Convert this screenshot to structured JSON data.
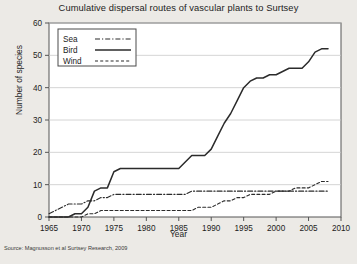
{
  "chart_data": {
    "type": "line",
    "title": "Cumulative dispersal routes of vascular plants to Surtsey",
    "xlabel": "Year",
    "ylabel": "Number of species",
    "xlim": [
      1965,
      2010
    ],
    "ylim": [
      0,
      60
    ],
    "xticks": [
      1965,
      1970,
      1975,
      1980,
      1985,
      1990,
      1995,
      2000,
      2005,
      2010
    ],
    "yticks": [
      0,
      10,
      20,
      30,
      40,
      50,
      60
    ],
    "grid": "horizontal",
    "legend_position": "top-left",
    "source": "Source: Magnusson et al Surtsey Research, 2009",
    "series": [
      {
        "name": "Sea",
        "style": "dash-dot",
        "x": [
          1965,
          1966,
          1967,
          1968,
          1969,
          1970,
          1971,
          1972,
          1973,
          1974,
          1975,
          1976,
          1977,
          1978,
          1979,
          1980,
          1981,
          1982,
          1983,
          1984,
          1985,
          1986,
          1987,
          1988,
          1989,
          1990,
          1991,
          1992,
          1993,
          1994,
          1995,
          1996,
          1997,
          1998,
          1999,
          2000,
          2001,
          2002,
          2003,
          2004,
          2005,
          2006,
          2007,
          2008
        ],
        "values": [
          1,
          2,
          3,
          4,
          4,
          4,
          5,
          5,
          6,
          6,
          7,
          7,
          7,
          7,
          7,
          7,
          7,
          7,
          7,
          7,
          7,
          7,
          8,
          8,
          8,
          8,
          8,
          8,
          8,
          8,
          8,
          8,
          8,
          8,
          8,
          8,
          8,
          8,
          8,
          8,
          8,
          8,
          8,
          8
        ]
      },
      {
        "name": "Bird",
        "style": "solid",
        "x": [
          1965,
          1966,
          1967,
          1968,
          1969,
          1970,
          1971,
          1972,
          1973,
          1974,
          1975,
          1976,
          1977,
          1978,
          1979,
          1980,
          1981,
          1982,
          1983,
          1984,
          1985,
          1986,
          1987,
          1988,
          1989,
          1990,
          1991,
          1992,
          1993,
          1994,
          1995,
          1996,
          1997,
          1998,
          1999,
          2000,
          2001,
          2002,
          2003,
          2004,
          2005,
          2006,
          2007,
          2008
        ],
        "values": [
          0,
          0,
          0,
          0,
          1,
          1,
          3,
          8,
          9,
          9,
          14,
          15,
          15,
          15,
          15,
          15,
          15,
          15,
          15,
          15,
          15,
          17,
          19,
          19,
          19,
          21,
          25,
          29,
          32,
          36,
          40,
          42,
          43,
          43,
          44,
          44,
          45,
          46,
          46,
          46,
          48,
          51,
          52,
          52
        ]
      },
      {
        "name": "Wind",
        "style": "dashed",
        "x": [
          1965,
          1966,
          1967,
          1968,
          1969,
          1970,
          1971,
          1972,
          1973,
          1974,
          1975,
          1976,
          1977,
          1978,
          1979,
          1980,
          1981,
          1982,
          1983,
          1984,
          1985,
          1986,
          1987,
          1988,
          1989,
          1990,
          1991,
          1992,
          1993,
          1994,
          1995,
          1996,
          1997,
          1998,
          1999,
          2000,
          2001,
          2002,
          2003,
          2004,
          2005,
          2006,
          2007,
          2008
        ],
        "values": [
          0,
          0,
          0,
          0,
          0,
          0,
          1,
          1,
          2,
          2,
          2,
          2,
          2,
          2,
          2,
          2,
          2,
          2,
          2,
          2,
          2,
          2,
          2,
          3,
          3,
          3,
          4,
          5,
          5,
          6,
          6,
          7,
          7,
          7,
          7,
          8,
          8,
          8,
          9,
          9,
          9,
          10,
          11,
          11
        ]
      }
    ]
  },
  "legend": {
    "items": [
      {
        "label": "Sea"
      },
      {
        "label": "Bird"
      },
      {
        "label": "Wind"
      }
    ]
  }
}
